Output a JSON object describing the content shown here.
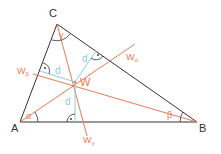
{
  "diagram": {
    "colors": {
      "triangle": "#333333",
      "bisector": "#e87a55",
      "radius": "#8ec9e8",
      "angle_label": "#e87a55",
      "vertex_label": "#333333"
    },
    "vertices": {
      "A": {
        "label": "A"
      },
      "B": {
        "label": "B"
      },
      "C": {
        "label": "C"
      }
    },
    "angles": {
      "alpha": "α",
      "beta": "β",
      "gamma": "γ"
    },
    "bisectors": {
      "w_alpha": {
        "label": "W",
        "sub": "α"
      },
      "w_beta": {
        "label": "W",
        "sub": "β"
      },
      "w_gamma": {
        "label": "W",
        "sub": "γ"
      }
    },
    "incenter": {
      "label": "W"
    },
    "radius_labels": [
      "d",
      "d",
      "d"
    ],
    "right_angle_marker": "·"
  }
}
